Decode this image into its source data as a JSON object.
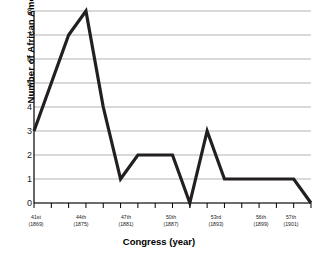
{
  "chart_data": {
    "type": "line",
    "title": "",
    "xlabel": "Congress (year)",
    "ylabel": "Number of African Americans",
    "ylim": [
      0,
      8
    ],
    "yticks": [
      "0",
      "1",
      "2",
      "3",
      "4",
      "5",
      "6",
      "7",
      "8"
    ],
    "grid": true,
    "legend": "none",
    "line_color": "#231f20",
    "grid_color": "#b3b3b3",
    "axis_color": "#000000",
    "categories": [
      "41st",
      "42nd",
      "43rd",
      "44th",
      "45th",
      "46th",
      "47th",
      "48th",
      "49th",
      "50th",
      "51st",
      "52nd",
      "53rd",
      "54th",
      "55th",
      "56th",
      "57th"
    ],
    "x": [
      41,
      42,
      43,
      44,
      45,
      46,
      47,
      48,
      49,
      50,
      51,
      52,
      53,
      54,
      55,
      56,
      57
    ],
    "values": [
      3,
      5,
      7,
      8,
      4,
      1,
      2,
      2,
      2,
      0,
      3,
      1,
      1,
      1,
      1,
      1,
      0
    ],
    "xtick_labels": [
      {
        "congress": "41st",
        "year": "(1869)",
        "x": 41
      },
      {
        "congress": "44th",
        "year": "(1875)",
        "x": 44
      },
      {
        "congress": "47th",
        "year": "(1881)",
        "x": 47
      },
      {
        "congress": "50th",
        "year": "(1887)",
        "x": 50
      },
      {
        "congress": "53rd",
        "year": "(1893)",
        "x": 53
      },
      {
        "congress": "56th",
        "year": "(1899)",
        "x": 56
      },
      {
        "congress": "57th",
        "year": "(1901)",
        "x": 57
      }
    ]
  }
}
